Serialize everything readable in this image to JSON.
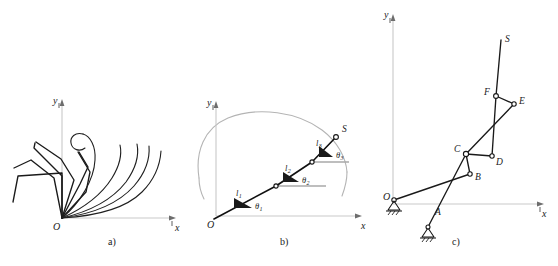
{
  "figure": {
    "panels": [
      {
        "id": "a",
        "caption": "a)",
        "axis": {
          "x_label": "x",
          "y_label": "y",
          "origin_label": "O"
        },
        "description": "overlaid finger linkage configurations"
      },
      {
        "id": "b",
        "caption": "b)",
        "axis": {
          "x_label": "x",
          "y_label": "y",
          "origin_label": "O"
        },
        "tip_label": "S",
        "segments": [
          {
            "length_label": "l",
            "length_sub": "1",
            "angle_label": "θ",
            "angle_sub": "1"
          },
          {
            "length_label": "l",
            "length_sub": "2",
            "angle_label": "θ",
            "angle_sub": "2"
          },
          {
            "length_label": "l",
            "length_sub": "3",
            "angle_label": "θ",
            "angle_sub": "3"
          }
        ],
        "description": "three link serial chain with joint angles and workspace envelope"
      },
      {
        "id": "c",
        "caption": "c)",
        "axis": {
          "x_label": "x",
          "y_label": "y",
          "origin_label": "O"
        },
        "joints": [
          {
            "label": "A"
          },
          {
            "label": "B"
          },
          {
            "label": "C"
          },
          {
            "label": "D"
          },
          {
            "label": "E"
          },
          {
            "label": "F"
          },
          {
            "label": "S"
          }
        ],
        "supports": [
          {
            "name": "ground-pin-left"
          },
          {
            "name": "ground-pin-lower"
          }
        ],
        "description": "equivalent planar linkage mechanism with two fixed pivots"
      }
    ]
  },
  "colors": {
    "axis": "#c9c9c9",
    "link": "#1a1a1a",
    "envelope": "#b4b4b4",
    "reference": "#a8a8a8",
    "background": "#ffffff"
  }
}
